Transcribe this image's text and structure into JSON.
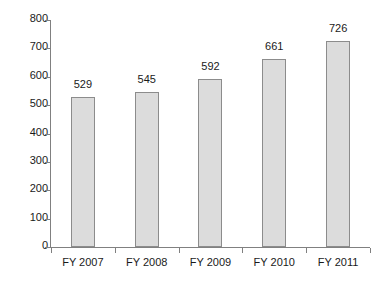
{
  "chart_data": {
    "type": "bar",
    "title": "",
    "subtitle": "",
    "xlabel": "",
    "ylabel": "",
    "categories": [
      "FY 2007",
      "FY 2008",
      "FY 2009",
      "FY 2010",
      "FY 2011"
    ],
    "values": [
      529,
      545,
      592,
      661,
      726
    ],
    "data_labels": [
      "529",
      "545",
      "592",
      "661",
      "726"
    ],
    "ylim": [
      0,
      800
    ],
    "ytick_values": [
      0,
      100,
      200,
      300,
      400,
      500,
      600,
      700,
      800
    ],
    "ytick_labels": [
      "0",
      "100",
      "200",
      "300",
      "400",
      "500",
      "600",
      "700",
      "800"
    ],
    "grid": false,
    "legend": false,
    "legend_position": "none",
    "bar_fill_color": "#dcdcdc",
    "bar_border_color": "#8c8c8c",
    "axis_color": "#808080",
    "text_color": "#1a1a1a",
    "background_color": "#ffffff"
  }
}
